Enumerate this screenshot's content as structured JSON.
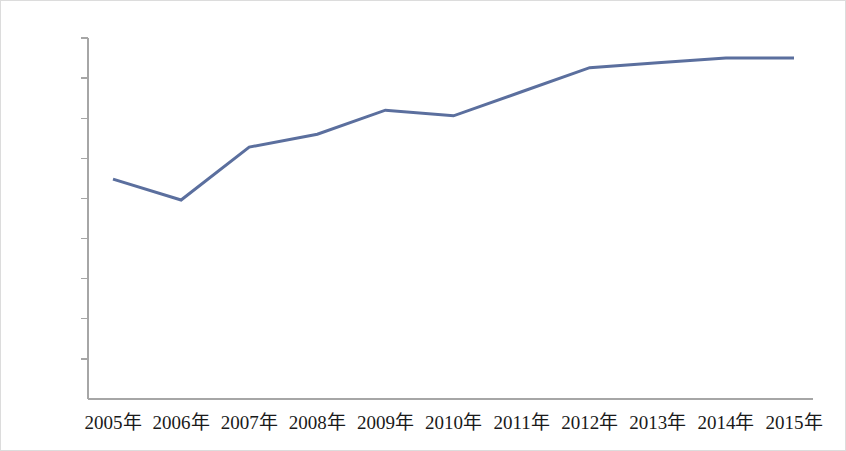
{
  "chart_data": {
    "type": "line",
    "title": "",
    "subtitle": "",
    "xlabel": "",
    "ylabel": "",
    "categories": [
      "2005年",
      "2006年",
      "2007年",
      "2008年",
      "2009年",
      "2010年",
      "2011年",
      "2012年",
      "2013年",
      "2014年",
      "2015年"
    ],
    "values": [
      2.74,
      2.48,
      3.14,
      3.3,
      3.6,
      3.53,
      3.83,
      4.13,
      4.19,
      4.25,
      4.25
    ],
    "value_unit": "%",
    "ylim": [
      0.0,
      4.5
    ],
    "ytick_labels": [
      "4.5%",
      "4.0%",
      "3.5%",
      "3.0%",
      "2.5%",
      "2.0%",
      "1.5%",
      "1.0%",
      "0.5%",
      "0.0%"
    ],
    "ytick_values": [
      4.5,
      4.0,
      3.5,
      3.0,
      2.5,
      2.0,
      1.5,
      1.0,
      0.5,
      0.0
    ],
    "grid": false,
    "legend": false,
    "legend_position": "none",
    "series_color": "#5b6f9e",
    "axis_color": "#a6a6a6",
    "text_color": "#1a1a1a",
    "border_color": "#dcdcdc",
    "line_width": 3,
    "markers": false
  },
  "geometry": {
    "plot_left": 87,
    "plot_right": 812,
    "plot_top": 37,
    "plot_bottom": 398,
    "x_first": 112,
    "x_last": 793,
    "tick_len": 7,
    "xlabel_y": 412,
    "ylabel_offset": 10
  }
}
